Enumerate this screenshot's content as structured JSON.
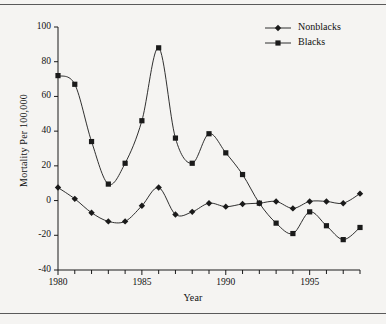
{
  "figure": {
    "background_color": "#f5f4f2",
    "has_top_rule": true,
    "has_bottom_rule": true,
    "rule_color": "#5a5a5a"
  },
  "chart_data": {
    "type": "line",
    "title": "",
    "xlabel": "Year",
    "ylabel": "Mortality Per 100,000",
    "x": [
      1980,
      1981,
      1982,
      1983,
      1984,
      1985,
      1986,
      1987,
      1988,
      1989,
      1990,
      1991,
      1992,
      1993,
      1994,
      1995,
      1996,
      1997,
      1998
    ],
    "xlim": [
      1980,
      1998
    ],
    "ylim": [
      -40,
      100
    ],
    "xticks": [
      1980,
      1981,
      1982,
      1983,
      1984,
      1985,
      1986,
      1987,
      1988,
      1989,
      1990,
      1991,
      1992,
      1993,
      1994,
      1995,
      1996,
      1997,
      1998
    ],
    "xtick_labels": [
      "1980",
      "",
      "",
      "",
      "",
      "1985",
      "",
      "",
      "",
      "",
      "1990",
      "",
      "",
      "",
      "",
      "1995",
      "",
      "",
      ""
    ],
    "yticks": [
      -40,
      -20,
      0,
      20,
      40,
      60,
      80,
      100
    ],
    "ytick_labels": [
      "-40",
      "-20",
      "0",
      "20",
      "40",
      "60",
      "80",
      "100"
    ],
    "grid": false,
    "legend_position": "top-right",
    "line_color": "#1a1a1a",
    "series": [
      {
        "name": "Nonblacks",
        "marker": "diamond",
        "color": "#1a1a1a",
        "values": [
          7.5,
          1.0,
          -7.0,
          -12.0,
          -12.0,
          -3.0,
          7.5,
          -8.0,
          -6.5,
          -1.5,
          -3.5,
          -2.0,
          -1.5,
          -0.5,
          -4.5,
          -0.5,
          -0.5,
          -1.5,
          4.0
        ]
      },
      {
        "name": "Blacks",
        "marker": "square",
        "color": "#1a1a1a",
        "values": [
          72.0,
          67.0,
          34.0,
          9.5,
          21.5,
          46.0,
          88.0,
          36.0,
          21.5,
          38.5,
          27.5,
          15.0,
          -1.5,
          -13.0,
          -19.0,
          -6.5,
          -14.5,
          -22.5,
          -15.5
        ]
      }
    ]
  },
  "legend": {
    "entries": [
      {
        "label": "Nonblacks",
        "marker": "diamond-icon"
      },
      {
        "label": "Blacks",
        "marker": "square-icon"
      }
    ]
  }
}
